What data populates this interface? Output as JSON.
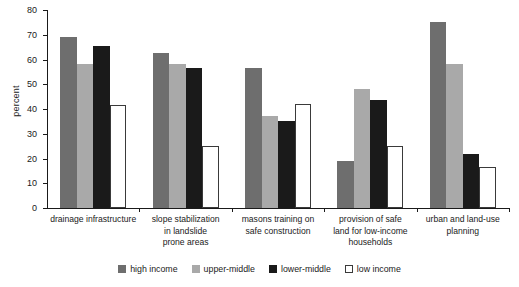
{
  "chart_data": {
    "type": "bar",
    "title": "",
    "xlabel": "",
    "ylabel": "percent",
    "ylim": [
      0,
      80
    ],
    "ytick_step": 10,
    "yticks": [
      "0",
      "10",
      "20",
      "30",
      "40",
      "50",
      "60",
      "70",
      "80"
    ],
    "grid": false,
    "legend_position": "bottom",
    "categories": [
      "drainage infrastructure",
      "slope stabilization in landslide prone areas",
      "masons training on safe construction",
      "provision of safe land for low-income households",
      "urban and land-use planning"
    ],
    "category_lines": [
      [
        "drainage infrastructure"
      ],
      [
        "slope stabilization",
        "in landslide",
        "prone areas"
      ],
      [
        "masons training on",
        "safe construction"
      ],
      [
        "provision of safe",
        "land for low-income",
        "households"
      ],
      [
        "urban and land-use",
        "planning"
      ]
    ],
    "series": [
      {
        "name": "high income",
        "color": "#6e6e6e",
        "values": [
          69,
          62.5,
          56.5,
          19,
          75
        ]
      },
      {
        "name": "upper-middle",
        "color": "#a9a9a9",
        "values": [
          58,
          58,
          37,
          48,
          58
        ]
      },
      {
        "name": "lower-middle",
        "color": "#1a1a1a",
        "values": [
          65.3,
          56.5,
          35,
          43.5,
          22
        ]
      },
      {
        "name": "low income",
        "color": "#ffffff",
        "values": [
          41.5,
          25,
          42,
          25,
          16.5
        ]
      }
    ]
  },
  "axis": {
    "y_title": "percent"
  }
}
